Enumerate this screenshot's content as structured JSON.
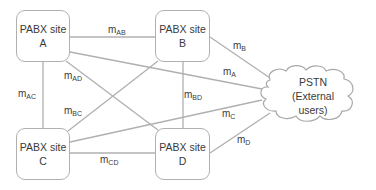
{
  "diagram": {
    "nodes": [
      {
        "id": "A",
        "line1": "PABX site",
        "line2": "A"
      },
      {
        "id": "B",
        "line1": "PABX site",
        "line2": "B"
      },
      {
        "id": "C",
        "line1": "PABX site",
        "line2": "C"
      },
      {
        "id": "D",
        "line1": "PABX site",
        "line2": "D"
      }
    ],
    "cloud": {
      "line1": "PSTN",
      "line2": "(External",
      "line3": "users)"
    },
    "edges": [
      {
        "from": "A",
        "to": "B",
        "label": "m",
        "sub": "AB"
      },
      {
        "from": "A",
        "to": "C",
        "label": "m",
        "sub": "AC"
      },
      {
        "from": "A",
        "to": "D",
        "label": "m",
        "sub": "AD"
      },
      {
        "from": "B",
        "to": "C",
        "label": "m",
        "sub": "BC"
      },
      {
        "from": "B",
        "to": "D",
        "label": "m",
        "sub": "BD"
      },
      {
        "from": "C",
        "to": "D",
        "label": "m",
        "sub": "CD"
      },
      {
        "from": "A",
        "to": "PSTN",
        "label": "m",
        "sub": "A"
      },
      {
        "from": "B",
        "to": "PSTN",
        "label": "m",
        "sub": "B"
      },
      {
        "from": "C",
        "to": "PSTN",
        "label": "m",
        "sub": "C"
      },
      {
        "from": "D",
        "to": "PSTN",
        "label": "m",
        "sub": "D"
      }
    ],
    "colors": {
      "line": "#b0b0b0",
      "text": "#3a3a3a",
      "background": "#ffffff"
    }
  }
}
